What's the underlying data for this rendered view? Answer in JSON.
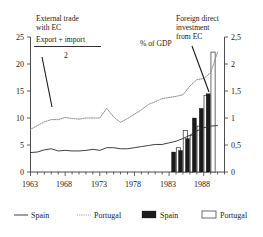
{
  "figure": {
    "name": "external-trade-and-fdi-chart",
    "center_label": "% of GDP"
  },
  "annotations": {
    "left": {
      "line1": "External trade",
      "line2": "with EC",
      "numerator": "Export  +  import",
      "denominator": "2"
    },
    "right": {
      "line1": "Foreign direct",
      "line2": "investment",
      "line3": "from EC"
    }
  },
  "legend": [
    {
      "label": "Spain",
      "marker": "solid-line",
      "color": "#2b2b2b"
    },
    {
      "label": "Portugal",
      "marker": "dotted-line",
      "color": "#9a9a9a"
    },
    {
      "label": "Spain",
      "marker": "filled-bar",
      "color": "#1b1b1b"
    },
    {
      "label": "Portugal",
      "marker": "hollow-bar",
      "color": "#ffffff"
    }
  ],
  "chart_data": {
    "type": "line",
    "title": "% of GDP",
    "xlabel": "",
    "ylabel": "",
    "grid": false,
    "legend_position": "bottom",
    "x": [
      1963,
      1964,
      1965,
      1966,
      1967,
      1968,
      1969,
      1970,
      1971,
      1972,
      1973,
      1974,
      1975,
      1976,
      1977,
      1978,
      1979,
      1980,
      1981,
      1982,
      1983,
      1984,
      1985,
      1986,
      1987,
      1988,
      1989,
      1990
    ],
    "xticks": [
      1963,
      1968,
      1973,
      1978,
      1983,
      1988
    ],
    "xlim": [
      1963,
      1991
    ],
    "left_axis": {
      "label": "",
      "ticks": [
        0,
        5,
        10,
        15,
        20,
        25
      ],
      "ticklabels": [
        "0",
        "5",
        "10",
        "15",
        "20",
        "25"
      ],
      "ylim": [
        0,
        25
      ]
    },
    "right_axis": {
      "label": "",
      "ticks": [
        0,
        0.5,
        1,
        1.5,
        2,
        2.5
      ],
      "ticklabels": [
        "0",
        "0,5",
        "1",
        "1,5",
        "2",
        "2,5"
      ],
      "ylim": [
        0,
        2.5
      ]
    },
    "series": [
      {
        "name": "Spain",
        "type": "line",
        "style": "solid",
        "axis": "left",
        "color": "#2b2b2b",
        "values": [
          3.6,
          3.7,
          4.1,
          4.3,
          3.9,
          4.0,
          3.9,
          3.9,
          4.0,
          4.2,
          4.0,
          4.5,
          4.5,
          4.3,
          4.3,
          4.5,
          4.7,
          4.9,
          5.1,
          5.1,
          5.4,
          5.7,
          6.2,
          6.8,
          7.6,
          8.2,
          8.5,
          8.6
        ]
      },
      {
        "name": "Portugal",
        "type": "line",
        "style": "dotted",
        "axis": "left",
        "color": "#9a9a9a",
        "values": [
          7.9,
          8.6,
          9.3,
          9.7,
          9.7,
          10.1,
          9.9,
          9.8,
          10.0,
          10.0,
          10.0,
          11.8,
          10.2,
          9.2,
          9.9,
          10.7,
          11.5,
          12.5,
          13.0,
          13.6,
          13.8,
          14.0,
          14.3,
          15.9,
          17.1,
          17.3,
          18.4,
          22.2
        ]
      },
      {
        "name": "Spain",
        "type": "bar",
        "style": "filled",
        "axis": "right",
        "color": "#1b1b1b",
        "x": [
          1984,
          1985,
          1986,
          1987,
          1988,
          1989,
          1990
        ],
        "values": [
          0.37,
          0.4,
          0.62,
          1.0,
          1.18,
          1.45,
          0.0
        ]
      },
      {
        "name": "Portugal",
        "type": "bar",
        "style": "hollow",
        "axis": "right",
        "color": "#ffffff",
        "x": [
          1984,
          1985,
          1986,
          1987,
          1988,
          1989,
          1990
        ],
        "values": [
          0.45,
          0.77,
          0.68,
          0.85,
          1.42,
          2.22,
          0.0
        ]
      }
    ]
  }
}
